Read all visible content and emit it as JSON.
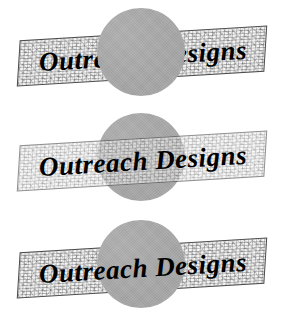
{
  "page": {
    "background_color": "#ffffff",
    "width": 289,
    "height": 322
  },
  "logo": {
    "text": "Outreach Designs",
    "text_color": "#000000",
    "banner_fill_color": "#f3f3f3",
    "banner_border_color": "#4a4a4a",
    "circle_color": "#a8a8a8"
  },
  "samples": [
    {
      "id": "sample-1",
      "name": "circle-in-front-opaque",
      "banner_text": "Outreach Designs",
      "stacking": "circle above banner",
      "banner_opacity": "1",
      "circle_opacity": "1"
    },
    {
      "id": "sample-2",
      "name": "banner-in-front-translucent",
      "banner_text": "Outreach Designs",
      "stacking": "banner above circle",
      "banner_opacity": "0.62",
      "circle_opacity": "1"
    },
    {
      "id": "sample-3",
      "name": "circle-over-fill-text-on-top",
      "banner_text": "Outreach Designs",
      "stacking": "text above circle above banner fill",
      "banner_opacity": "1",
      "circle_opacity": "1"
    }
  ]
}
